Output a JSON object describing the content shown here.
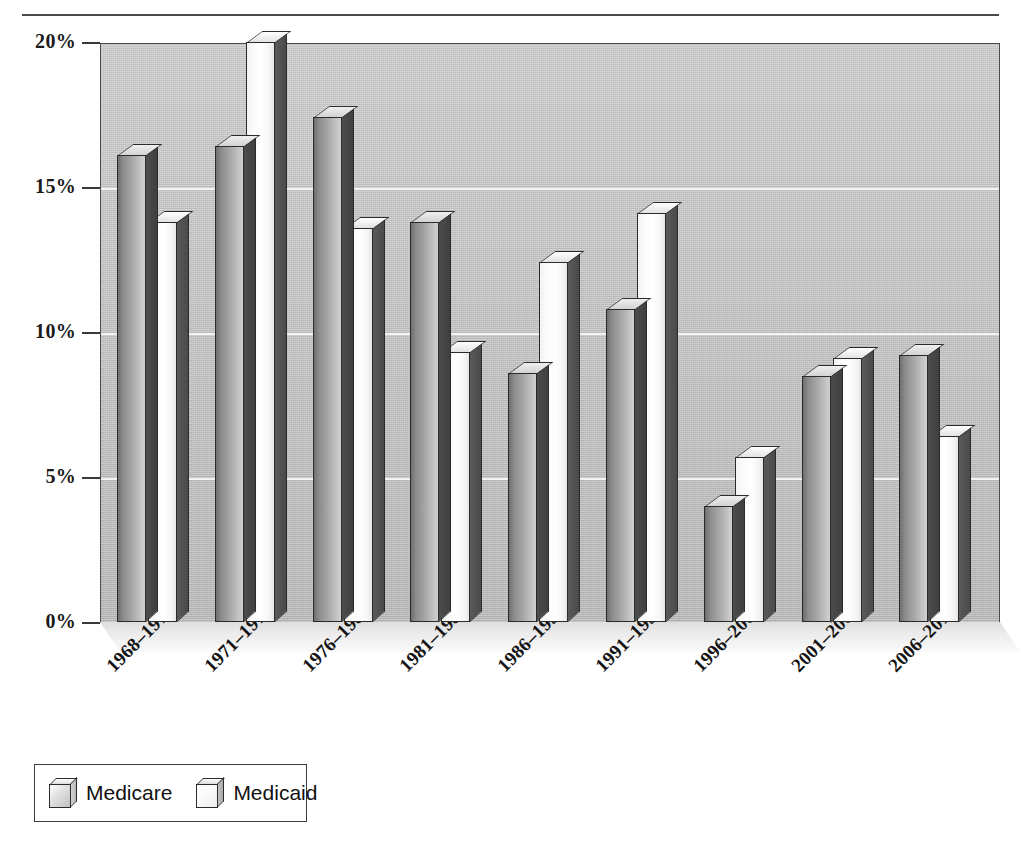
{
  "chart_data": {
    "type": "bar",
    "title": "",
    "subtitle": "",
    "xlabel": "",
    "ylabel": "",
    "ylim": [
      0,
      20
    ],
    "ytick_labels": [
      "0%",
      "5%",
      "10%",
      "15%",
      "20%"
    ],
    "ytick_values": [
      0,
      5,
      10,
      15,
      20
    ],
    "grid": true,
    "legend_position": "bottom-left",
    "style": "3d-grouped-bars",
    "categories": [
      "1968–1970",
      "1971–1975",
      "1976–1980",
      "1981–1985",
      "1986–1990",
      "1991–1995",
      "1996–2000",
      "2001–2005",
      "2006–2010"
    ],
    "series": [
      {
        "name": "Medicare",
        "color": "#a9a9a9",
        "values": [
          16.1,
          16.4,
          17.4,
          13.8,
          8.6,
          10.8,
          4.0,
          8.5,
          9.2
        ]
      },
      {
        "name": "Medicaid",
        "color": "#fdfdfd",
        "values": [
          13.8,
          20.0,
          13.6,
          9.3,
          12.4,
          14.1,
          5.7,
          9.1,
          6.4
        ]
      }
    ]
  },
  "legend": {
    "entries": [
      {
        "label": "Medicare",
        "swatch": "cube-gray-icon"
      },
      {
        "label": "Medicaid",
        "swatch": "cube-white-icon"
      }
    ]
  },
  "caption": {
    "text": ""
  }
}
